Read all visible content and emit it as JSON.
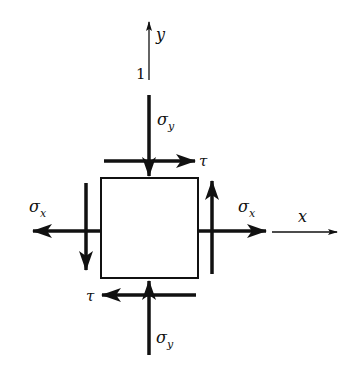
{
  "diagram": {
    "axes": {
      "y_label": "y",
      "x_label": "x",
      "origin_label": "1"
    },
    "stresses": {
      "sigma_y_top": {
        "symbol": "σ",
        "subscript": "y",
        "direction": "down (compressive onto top face)"
      },
      "sigma_y_bottom": {
        "symbol": "σ",
        "subscript": "y",
        "direction": "up (compressive onto bottom face)"
      },
      "sigma_x_left": {
        "symbol": "σ",
        "subscript": "x",
        "direction": "left (tensile)"
      },
      "sigma_x_right": {
        "symbol": "σ",
        "subscript": "x",
        "direction": "right (tensile)"
      },
      "tau_top": {
        "symbol": "τ",
        "direction": "right"
      },
      "tau_bottom": {
        "symbol": "τ",
        "direction": "left"
      },
      "tau_left": {
        "direction": "down"
      },
      "tau_right": {
        "direction": "up"
      }
    },
    "colors": {
      "stroke": "#111111",
      "background": "#ffffff"
    }
  }
}
